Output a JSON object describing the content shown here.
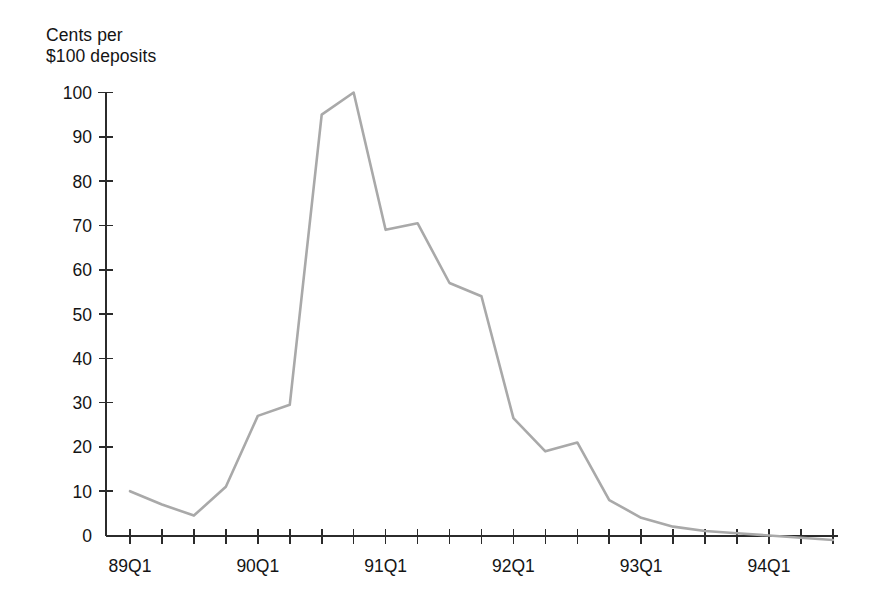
{
  "chart_data": {
    "type": "line",
    "title": "",
    "subtitle": "",
    "ylabel": "Cents per\n$100 deposits",
    "xlabel": "",
    "ylim": [
      -2,
      100
    ],
    "yticks": [
      0,
      10,
      20,
      30,
      40,
      50,
      60,
      70,
      80,
      90,
      100
    ],
    "ytick_labels": [
      "0",
      "10",
      "20",
      "30",
      "40",
      "50",
      "60",
      "70",
      "80",
      "90",
      "100"
    ],
    "grid": false,
    "legend": "none",
    "x_tick_count": 23,
    "x_labeled_ticks": [
      {
        "index": 0,
        "label": "89Q1"
      },
      {
        "index": 4,
        "label": "90Q1"
      },
      {
        "index": 8,
        "label": "91Q1"
      },
      {
        "index": 12,
        "label": "92Q1"
      },
      {
        "index": 16,
        "label": "93Q1"
      },
      {
        "index": 20,
        "label": "94Q1"
      }
    ],
    "categories": [
      "89Q1",
      "89Q2",
      "89Q3",
      "89Q4",
      "90Q1",
      "90Q2",
      "90Q3",
      "90Q4",
      "91Q1",
      "91Q2",
      "91Q3",
      "91Q4",
      "92Q1",
      "92Q2",
      "92Q3",
      "92Q4",
      "93Q1",
      "93Q2",
      "93Q3",
      "93Q4",
      "94Q1",
      "94Q2",
      "94Q3"
    ],
    "values": [
      10,
      7,
      4.5,
      11,
      27,
      29.5,
      95,
      100,
      69,
      70.5,
      57,
      54,
      26.5,
      19,
      21,
      8,
      4,
      2,
      1,
      0.5,
      0,
      -0.5,
      -1
    ],
    "series": [
      {
        "name": "Cents per $100 deposits",
        "color": "#a9a9a9",
        "values": [
          10,
          7,
          4.5,
          11,
          27,
          29.5,
          95,
          100,
          69,
          70.5,
          57,
          54,
          26.5,
          19,
          21,
          8,
          4,
          2,
          1,
          0.5,
          0,
          -0.5,
          -1
        ]
      }
    ],
    "colors": {
      "line": "#a9a9a9",
      "axis": "#2b2b2b",
      "text": "#141414",
      "background": "#ffffff"
    }
  }
}
